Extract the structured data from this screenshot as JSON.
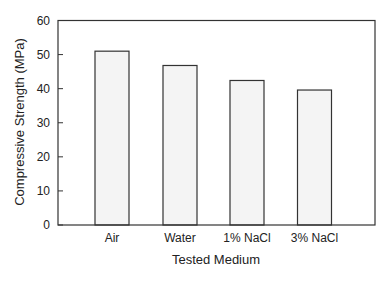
{
  "chart_data": {
    "type": "bar",
    "title": "",
    "xlabel": "Tested Medium",
    "ylabel": "Compressive Strength (MPa)",
    "categories": [
      "Air",
      "Water",
      "1% NaCl",
      "3% NaCl"
    ],
    "values": [
      51.0,
      46.8,
      42.4,
      39.6
    ],
    "ylim": [
      0,
      60
    ],
    "yticks": [
      0,
      10,
      20,
      30,
      40,
      50,
      60
    ],
    "grid": false,
    "legend": null,
    "bar_fill": "#f4f4f4",
    "bar_edge": "#333333"
  }
}
